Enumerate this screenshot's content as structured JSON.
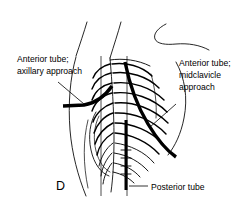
{
  "figure": {
    "panel_letter": "D",
    "background_color": "#ffffff",
    "ink_color": "#000000"
  },
  "labels": {
    "anterior_axillary": {
      "name": "anterior-tube-axillary-approach",
      "line1": "Anterior tube;",
      "line2": "axillary approach"
    },
    "anterior_midclavicle": {
      "name": "anterior-tube-midclavicle-approach",
      "line1": "Anterior tube;",
      "line2": "midclavicle",
      "line3": "approach"
    },
    "posterior": {
      "name": "posterior-tube",
      "line1": "Posterior tube"
    }
  },
  "annotations": {
    "leader_axillary": "leader-line-axillary",
    "leader_midclavicle": "leader-line-midclavicle",
    "leader_posterior": "leader-line-posterior"
  }
}
